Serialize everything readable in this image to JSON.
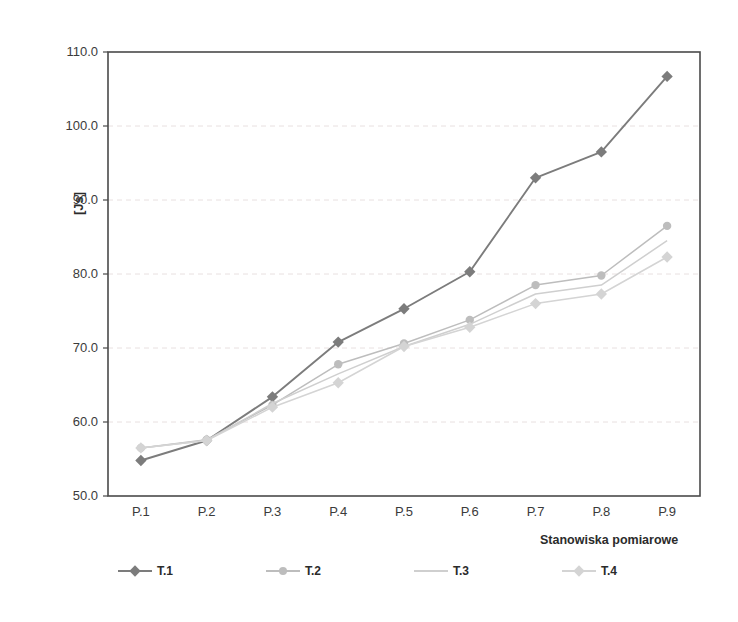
{
  "chart_data": {
    "type": "line",
    "title": "",
    "xlabel": "Stanowiska pomiarowe",
    "ylabel": "[Js]",
    "categories": [
      "P.1",
      "P.2",
      "P.3",
      "P.4",
      "P.5",
      "P.6",
      "P.7",
      "P.8",
      "P.9"
    ],
    "ylim": [
      50.0,
      110.0
    ],
    "yticks": [
      "50.0",
      "60.0",
      "70.0",
      "80.0",
      "90.0",
      "100.0",
      "110.0"
    ],
    "ytick_values": [
      50.0,
      60.0,
      70.0,
      80.0,
      90.0,
      100.0,
      110.0
    ],
    "grid": "horizontal-dashed-light",
    "legend_position": "bottom",
    "series": [
      {
        "name": "T.1",
        "color": "#7c7c7c",
        "marker": "diamond",
        "values": [
          54.8,
          57.5,
          63.4,
          70.8,
          75.3,
          80.3,
          93.0,
          96.5,
          106.7
        ]
      },
      {
        "name": "T.2",
        "color": "#bdbdbd",
        "marker": "circle",
        "values": [
          56.5,
          57.6,
          62.3,
          67.8,
          70.6,
          73.8,
          78.5,
          79.8,
          86.5
        ]
      },
      {
        "name": "T.3",
        "color": "#cfcfcf",
        "marker": "none",
        "values": [
          56.5,
          57.5,
          62.5,
          66.5,
          70.2,
          73.2,
          77.3,
          78.5,
          84.5
        ]
      },
      {
        "name": "T.4",
        "color": "#d4d4d4",
        "marker": "diamond",
        "values": [
          56.5,
          57.5,
          62.0,
          65.3,
          70.2,
          72.8,
          76.0,
          77.3,
          82.3
        ]
      }
    ]
  },
  "plot": {
    "border_color": "#4a4a4a",
    "grid_color": "#e8e0e0",
    "background": "#ffffff"
  }
}
